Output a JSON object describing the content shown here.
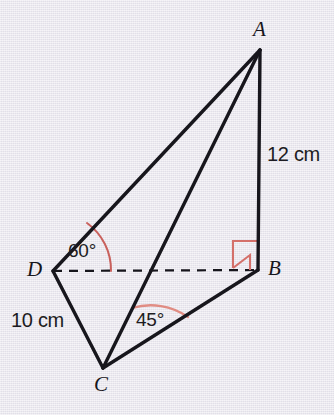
{
  "figure": {
    "background_color": "#e9e7ee",
    "line_color": "#17161c",
    "accent_color": "#d4706a",
    "vertices": {
      "A": {
        "label": "A",
        "x": 260,
        "y": 50
      },
      "B": {
        "label": "B",
        "x": 258,
        "y": 270
      },
      "C": {
        "label": "C",
        "x": 103,
        "y": 368
      },
      "D": {
        "label": "D",
        "x": 53,
        "y": 271
      }
    },
    "edges": [
      {
        "name": "AB",
        "from": "A",
        "to": "B",
        "style": "solid"
      },
      {
        "name": "AD",
        "from": "A",
        "to": "D",
        "style": "solid"
      },
      {
        "name": "AC",
        "from": "A",
        "to": "C",
        "style": "solid"
      },
      {
        "name": "DC",
        "from": "D",
        "to": "C",
        "style": "solid"
      },
      {
        "name": "CB",
        "from": "C",
        "to": "B",
        "style": "solid"
      },
      {
        "name": "DB",
        "from": "D",
        "to": "B",
        "style": "dashed"
      }
    ],
    "measures": {
      "side_ab": "12 cm",
      "side_dc": "10 cm",
      "angle_d": "60°",
      "angle_c": "45°",
      "right_angle_b": "90°"
    }
  }
}
